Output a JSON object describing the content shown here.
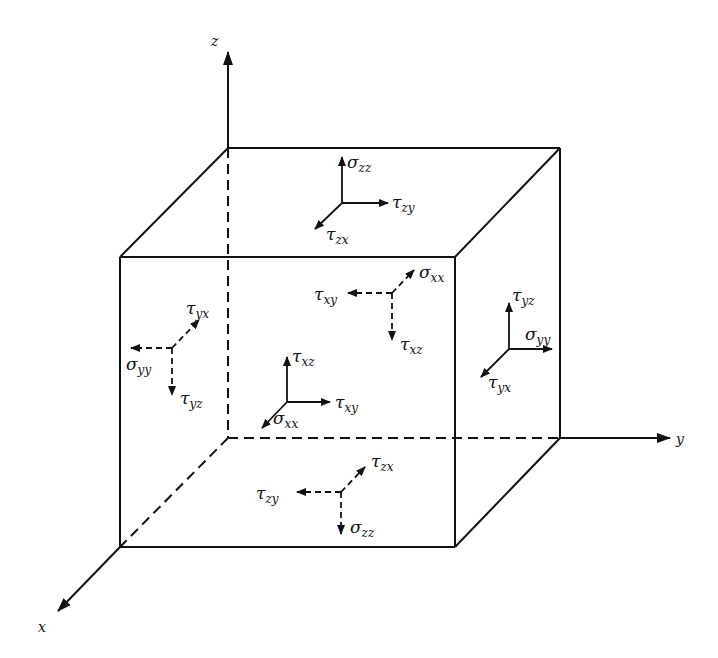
{
  "figure": {
    "axes": {
      "z": {
        "label": "z"
      },
      "y": {
        "label": "y"
      },
      "x": {
        "label": "x"
      }
    },
    "faces": {
      "top": {
        "normal": {
          "sym": "σ",
          "sub": "zz"
        },
        "shear1": {
          "sym": "τ",
          "sub": "zy"
        },
        "shear2": {
          "sym": "τ",
          "sub": "zx"
        }
      },
      "back": {
        "normal": {
          "sym": "σ",
          "sub": "xx"
        },
        "shear1": {
          "sym": "τ",
          "sub": "xy"
        },
        "shear2": {
          "sym": "τ",
          "sub": "xz"
        }
      },
      "left": {
        "normal": {
          "sym": "σ",
          "sub": "yy"
        },
        "shear1": {
          "sym": "τ",
          "sub": "yx"
        },
        "shear2": {
          "sym": "τ",
          "sub": "yz"
        }
      },
      "front": {
        "normal": {
          "sym": "σ",
          "sub": "xx"
        },
        "shear1": {
          "sym": "τ",
          "sub": "xy"
        },
        "shear2": {
          "sym": "τ",
          "sub": "xz"
        }
      },
      "right": {
        "normal": {
          "sym": "σ",
          "sub": "yy"
        },
        "shear1": {
          "sym": "τ",
          "sub": "yz"
        },
        "shear2": {
          "sym": "τ",
          "sub": "yx"
        }
      },
      "bottom": {
        "normal": {
          "sym": "σ",
          "sub": "zz"
        },
        "shear1": {
          "sym": "τ",
          "sub": "zy"
        },
        "shear2": {
          "sym": "τ",
          "sub": "zx"
        }
      }
    }
  }
}
